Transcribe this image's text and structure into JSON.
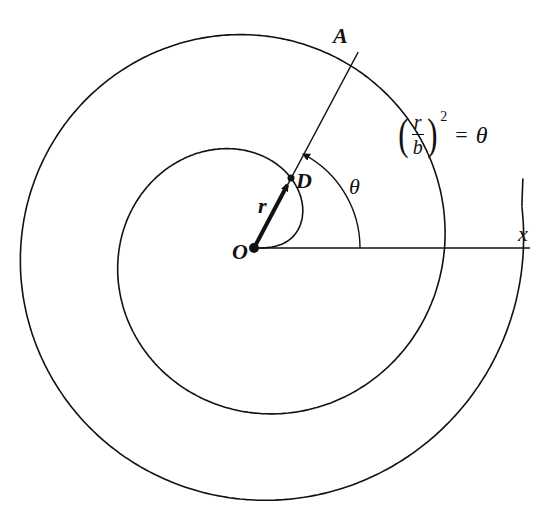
{
  "figure": {
    "width": 557,
    "height": 524,
    "stroke_color": "#111111",
    "background": "#ffffff",
    "origin": {
      "x": 254,
      "y": 248
    },
    "spiral": {
      "equation_type": "fermat",
      "b_px": 76,
      "theta_start": 0,
      "theta_end_rad": 12.72
    },
    "x_axis": {
      "x_end": 530,
      "y": 248
    },
    "line_OA": {
      "angle_deg": 62,
      "length": 222
    },
    "point_D": {
      "x": 291,
      "y": 178
    },
    "theta_arc": {
      "radius": 106,
      "angle_deg": 62
    },
    "r_vector": {
      "from": "O",
      "to": "D"
    }
  },
  "labels": {
    "A": "A",
    "D": "D",
    "O": "O",
    "r": "r",
    "theta": "θ",
    "x": "x"
  },
  "equation": {
    "left_paren": "(",
    "numerator": "r",
    "denominator": "b",
    "right_paren": ")",
    "exponent": "2",
    "equals": "=",
    "rhs": "θ"
  }
}
